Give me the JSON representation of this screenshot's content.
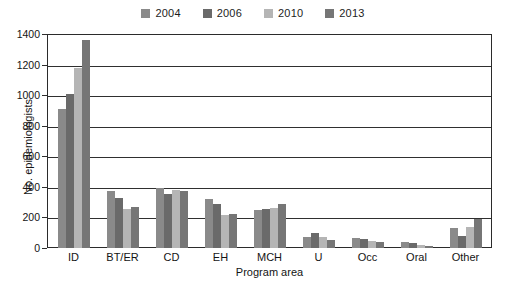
{
  "chart_data": {
    "type": "bar",
    "title": "",
    "xlabel": "Program area",
    "ylabel": "No. epidemiologists",
    "ylim": [
      0,
      1400
    ],
    "ytick_step": 200,
    "yticks": [
      0,
      200,
      400,
      600,
      800,
      1000,
      1200,
      1400
    ],
    "grid": true,
    "grid_axis": "y",
    "legend_position": "top-center",
    "legend_orientation": "horizontal",
    "categories": [
      "ID",
      "BT/ER",
      "CD",
      "EH",
      "MCH",
      "U",
      "Occ",
      "Oral",
      "Other"
    ],
    "series": [
      {
        "name": "2004",
        "color": "#8a8a8a",
        "values": [
          910,
          370,
          390,
          320,
          250,
          75,
          65,
          40,
          130
        ]
      },
      {
        "name": "2006",
        "color": "#6a6a6a",
        "values": [
          1010,
          330,
          355,
          290,
          255,
          95,
          60,
          35,
          80
        ]
      },
      {
        "name": "2010",
        "color": "#b5b5b5",
        "values": [
          1180,
          255,
          380,
          215,
          265,
          75,
          45,
          20,
          140
        ]
      },
      {
        "name": "2013",
        "color": "#767676",
        "values": [
          1360,
          270,
          375,
          225,
          290,
          55,
          40,
          15,
          190
        ]
      }
    ]
  }
}
